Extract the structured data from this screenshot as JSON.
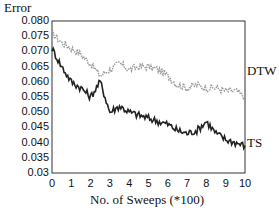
{
  "chart_data": {
    "type": "line",
    "title": "",
    "xlabel": "No. of Sweeps (*100)",
    "ylabel": "Error",
    "xlim": [
      0,
      10
    ],
    "ylim": [
      0.03,
      0.08
    ],
    "grid": false,
    "legend_position": "inline-right",
    "x_ticks": [
      "0",
      "1",
      "2",
      "3",
      "4",
      "5",
      "6",
      "7",
      "8",
      "9",
      "10"
    ],
    "y_ticks": [
      "0.080",
      "0.075",
      "0.070",
      "0.065",
      "0.060",
      "0.055",
      "0.050",
      "0.045",
      "0.040",
      "0.035",
      "0.03"
    ],
    "x": [
      0,
      0.5,
      1,
      1.5,
      2,
      2.5,
      3,
      3.5,
      4,
      4.5,
      5,
      5.5,
      6,
      6.5,
      7,
      7.5,
      8,
      8.5,
      9,
      9.5,
      10
    ],
    "series": [
      {
        "name": "DTW",
        "color": "#9a9a9a",
        "style": "dotted",
        "values": [
          0.076,
          0.073,
          0.071,
          0.069,
          0.066,
          0.062,
          0.064,
          0.066,
          0.064,
          0.065,
          0.065,
          0.064,
          0.062,
          0.059,
          0.058,
          0.059,
          0.058,
          0.058,
          0.057,
          0.057,
          0.055
        ]
      },
      {
        "name": "TS",
        "color": "#222222",
        "style": "solid",
        "values": [
          0.071,
          0.065,
          0.06,
          0.058,
          0.055,
          0.06,
          0.05,
          0.052,
          0.05,
          0.049,
          0.048,
          0.047,
          0.046,
          0.044,
          0.043,
          0.044,
          0.047,
          0.043,
          0.041,
          0.04,
          0.039
        ]
      }
    ]
  }
}
